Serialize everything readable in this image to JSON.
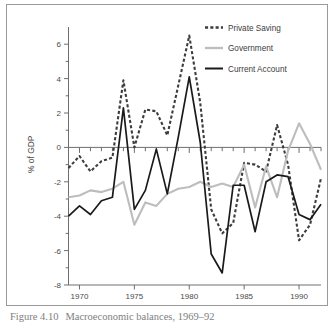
{
  "figure": {
    "caption_number": "Figure 4.10",
    "caption_text": "Macroeconomic balances, 1969–92"
  },
  "chart_data": {
    "type": "line",
    "title": "",
    "xlabel": "",
    "ylabel": "% of GDP",
    "xlim": [
      1969,
      1992
    ],
    "ylim": [
      -8,
      7
    ],
    "yticks": [
      -8,
      -6,
      -4,
      -2,
      0,
      2,
      4,
      6
    ],
    "ytick_labels": [
      "-8",
      "-6",
      "-4",
      "-2",
      "0",
      "2",
      "4",
      "6"
    ],
    "y_minor_ticks": [
      -7,
      -5,
      -3,
      -1,
      1,
      3,
      5
    ],
    "xticks": [
      1970,
      1975,
      1980,
      1985,
      1990
    ],
    "xtick_labels": [
      "1970",
      "1975",
      "1980",
      "1985",
      "1990"
    ],
    "x_minor_ticks": [
      1969,
      1971,
      1972,
      1973,
      1974,
      1976,
      1977,
      1978,
      1979,
      1981,
      1982,
      1983,
      1984,
      1986,
      1987,
      1988,
      1989,
      1991,
      1992
    ],
    "grid": false,
    "zero_line": true,
    "legend_position": "top-right",
    "x": [
      1969,
      1970,
      1971,
      1972,
      1973,
      1974,
      1975,
      1976,
      1977,
      1978,
      1979,
      1980,
      1981,
      1982,
      1983,
      1984,
      1985,
      1986,
      1987,
      1988,
      1989,
      1990,
      1991,
      1992
    ],
    "series": [
      {
        "name": "Private Saving",
        "style": "dashed",
        "color": "#3d3d3d",
        "values": [
          -1.2,
          -0.5,
          -1.4,
          -0.8,
          -0.6,
          3.9,
          0.0,
          2.2,
          2.1,
          0.7,
          3.6,
          6.5,
          2.6,
          -3.6,
          -5.0,
          -4.4,
          -0.9,
          -1.0,
          -1.4,
          1.3,
          -1.0,
          -5.4,
          -4.5,
          -1.8
        ]
      },
      {
        "name": "Government",
        "style": "solid",
        "color": "#bdbdbd",
        "values": [
          -2.9,
          -2.8,
          -2.5,
          -2.6,
          -2.4,
          -2.0,
          -4.5,
          -3.2,
          -3.4,
          -2.7,
          -2.4,
          -2.3,
          -2.0,
          -2.3,
          -2.1,
          -2.3,
          -1.0,
          -3.5,
          -1.1,
          -2.9,
          -0.2,
          1.4,
          0.2,
          -1.3
        ]
      },
      {
        "name": "Current Account",
        "style": "solid",
        "color": "#1a1a1a",
        "values": [
          -4.0,
          -3.4,
          -3.9,
          -3.1,
          -2.9,
          2.3,
          -3.6,
          -2.5,
          -0.1,
          -2.7,
          0.6,
          4.1,
          0.3,
          -6.2,
          -7.3,
          -2.2,
          -2.2,
          -4.9,
          -2.0,
          -1.6,
          -1.7,
          -3.9,
          -4.2,
          -3.3
        ]
      }
    ]
  },
  "legend": {
    "items": [
      {
        "label": "Private Saving"
      },
      {
        "label": "Government"
      },
      {
        "label": "Current Account"
      }
    ]
  }
}
